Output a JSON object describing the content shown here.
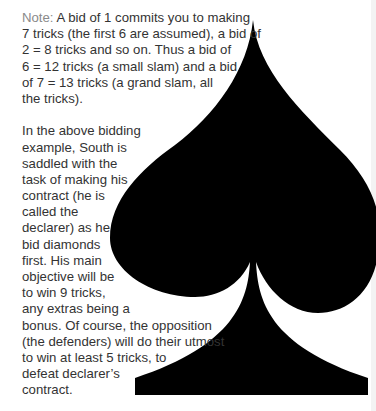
{
  "note": {
    "label": "Note:",
    "lines": [
      " A bid of 1 commits you to making",
      "7 tricks (the first 6 are assumed), a bid of",
      "2 = 8 tricks and so on. Thus a bid of",
      "6 = 12 tricks (a small slam) and a bid",
      "of 7 = 13 tricks (a grand slam, all",
      "the tricks)."
    ]
  },
  "paragraph": {
    "lines": [
      "In the above bidding",
      "example, South is",
      "saddled with the",
      "task of making his",
      "contract (he is",
      "called the",
      "declarer) as he",
      "bid diamonds",
      "first. His main",
      "objective will be",
      "to win 9 tricks,",
      "any extras being a",
      "bonus. Of course, the opposition",
      "(the defenders) will do their utmost",
      "to win at least 5 tricks, to",
      "defeat declarer’s",
      "contract."
    ]
  },
  "illustration": {
    "icon": "spade-suit-icon",
    "color": "#000000"
  }
}
